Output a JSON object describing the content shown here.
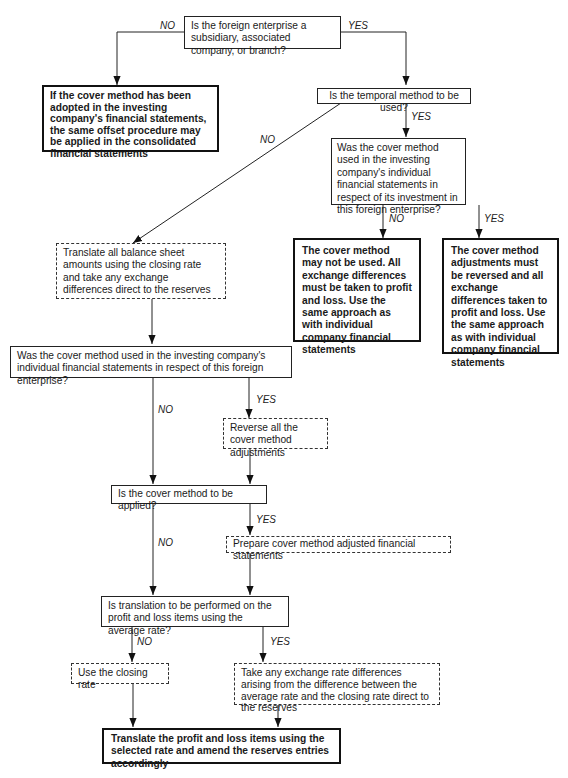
{
  "diagram": {
    "type": "flowchart",
    "nodes": {
      "q_subsidiary": "Is the foreign enterprise a subsidiary, associated company, or branch?",
      "end_offset": "If the cover method has been adopted in the investing company's financial statements, the same offset procedure may be applied in the consolidated financial statements",
      "q_temporal": "Is the temporal method to be used?",
      "q_cover_investment": "Was the cover method used in the investing company's individual financial statements in respect of its investment in this foreign enterprise?",
      "end_not_used": "The cover method may not be used.  All exchange differences must be taken to profit and loss.  Use the same approach as with individual company financial statements",
      "end_reversed": "The cover method adjustments must be reversed and all exchange differences taken to profit and loss. Use the same approach as with individual company financial statements",
      "act_translate_balance": "Translate all balance sheet amounts using the closing rate and take any exchange differences direct to the reserves",
      "q_cover_enterprise": "Was the cover method used in the investing company's individual financial statements in respect of this foreign enterprise?",
      "act_reverse": "Reverse all the cover method adjustments",
      "q_cover_apply": "Is the cover method to be applied?",
      "act_prepare": "Prepare cover method adjusted financial statements",
      "q_average_rate": "Is translation to be performed on the profit and loss items using the average rate?",
      "act_closing_rate": "Use the closing rate",
      "act_take_differences": "Take any exchange rate differences arising from the difference between the average rate and the closing rate direct to the reserves",
      "end_translate_pl": "Translate the profit and loss items using the selected rate and amend the reserves entries accordingly"
    },
    "labels": {
      "no": "NO",
      "yes": "YES"
    },
    "edges": [
      {
        "from": "q_subsidiary",
        "to": "end_offset",
        "label": "NO"
      },
      {
        "from": "q_subsidiary",
        "to": "q_temporal",
        "label": "YES"
      },
      {
        "from": "q_temporal",
        "to": "act_translate_balance",
        "label": "NO"
      },
      {
        "from": "q_temporal",
        "to": "q_cover_investment",
        "label": "YES"
      },
      {
        "from": "q_cover_investment",
        "to": "end_not_used",
        "label": "NO"
      },
      {
        "from": "q_cover_investment",
        "to": "end_reversed",
        "label": "YES"
      },
      {
        "from": "act_translate_balance",
        "to": "q_cover_enterprise",
        "label": ""
      },
      {
        "from": "q_cover_enterprise",
        "to": "q_cover_apply",
        "label": "NO"
      },
      {
        "from": "q_cover_enterprise",
        "to": "act_reverse",
        "label": "YES"
      },
      {
        "from": "act_reverse",
        "to": "q_cover_apply",
        "label": ""
      },
      {
        "from": "q_cover_apply",
        "to": "q_average_rate",
        "label": "NO"
      },
      {
        "from": "q_cover_apply",
        "to": "act_prepare",
        "label": "YES"
      },
      {
        "from": "act_prepare",
        "to": "q_average_rate",
        "label": ""
      },
      {
        "from": "q_average_rate",
        "to": "act_closing_rate",
        "label": "NO"
      },
      {
        "from": "q_average_rate",
        "to": "act_take_differences",
        "label": "YES"
      },
      {
        "from": "act_closing_rate",
        "to": "end_translate_pl",
        "label": ""
      },
      {
        "from": "act_take_differences",
        "to": "end_translate_pl",
        "label": ""
      }
    ]
  }
}
